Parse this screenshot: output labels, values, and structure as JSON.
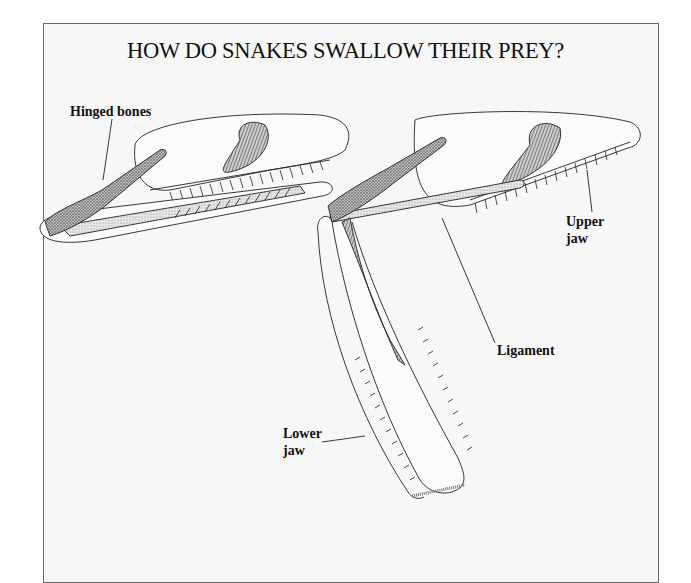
{
  "diagram": {
    "title": "HOW DO SNAKES SWALLOW THEIR PREY?",
    "figures": [
      {
        "name": "snake-skull-closed",
        "description": "Snake skull with jaw closed"
      },
      {
        "name": "snake-skull-open",
        "description": "Snake skull with lower jaw unhinged and dropped"
      }
    ],
    "labels": {
      "hinged_bones": "Hinged bones",
      "upper_jaw_line1": "Upper",
      "upper_jaw_line2": "jaw",
      "ligament": "Ligament",
      "lower_jaw_line1": "Lower",
      "lower_jaw_line2": "jaw"
    },
    "colors": {
      "background": "#f7f7f7",
      "frame_border": "#6a6a6a",
      "ink": "#111111"
    }
  }
}
